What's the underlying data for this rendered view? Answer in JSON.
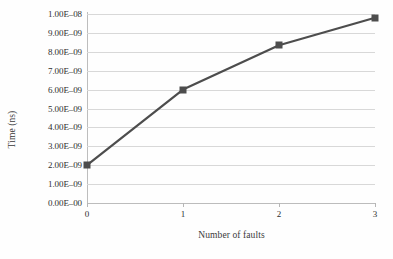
{
  "chart_data": {
    "type": "line",
    "title": "",
    "xlabel": "Number of faults",
    "ylabel": "Time (ns)",
    "x": [
      0,
      1,
      2,
      3
    ],
    "values": [
      2e-09,
      6e-09,
      8.35e-09,
      9.8e-09
    ],
    "series": [
      {
        "name": "Time",
        "x": [
          0,
          1,
          2,
          3
        ],
        "values": [
          2e-09,
          6e-09,
          8.35e-09,
          9.8e-09
        ]
      }
    ],
    "xlim": [
      0,
      3
    ],
    "ylim": [
      0,
      1e-08
    ],
    "xtick_labels": [
      "0",
      "1",
      "2",
      "3"
    ],
    "ytick_labels": [
      "0.00E–00",
      "1.00E–09",
      "2.00E–09",
      "3.00E–09",
      "4.00E–09",
      "5.00E–09",
      "6.00E–09",
      "7.00E–09",
      "8.00E–09",
      "9.00E–09",
      "1.00E–08"
    ],
    "ytick_values": [
      0,
      1e-09,
      2e-09,
      3e-09,
      4e-09,
      5e-09,
      6e-09,
      7e-09,
      8e-09,
      9e-09,
      1e-08
    ],
    "grid": "horizontal",
    "legend": "none",
    "marker": "square",
    "line_color": "#4d4d4d",
    "marker_color": "#4d4d4d",
    "gridline_color": "#d8d8d8",
    "axis_color": "#bdbdbd",
    "background_color": "#fefefe"
  }
}
